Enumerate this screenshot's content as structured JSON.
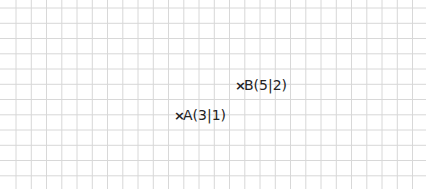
{
  "grid": {
    "x0": 16,
    "y0": 8,
    "x1": 418,
    "y1": 181,
    "cell": 15.25,
    "line_color": "#d8d8d8"
  },
  "points": [
    {
      "name": "A",
      "label": "A(3|1)",
      "x": 3,
      "y": 1,
      "px": 179,
      "py": 116
    },
    {
      "name": "B",
      "label": "B(5|2)",
      "x": 5,
      "y": 2,
      "px": 240,
      "py": 86
    }
  ],
  "marker": "×"
}
